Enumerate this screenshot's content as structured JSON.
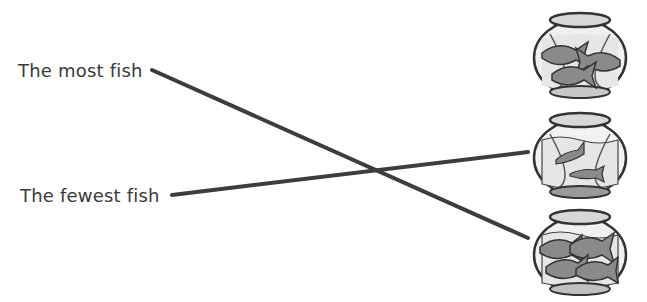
{
  "worksheet": {
    "labels": [
      {
        "id": "most",
        "text": "The most fish"
      },
      {
        "id": "fewest",
        "text": "The fewest fish"
      }
    ],
    "bowls": [
      {
        "position": "top",
        "fish_count": 3
      },
      {
        "position": "middle",
        "fish_count": 2
      },
      {
        "position": "bottom",
        "fish_count": 4
      }
    ],
    "matches": [
      {
        "label": "The most fish",
        "bowl": "bottom",
        "fish_count": 4
      },
      {
        "label": "The fewest fish",
        "bowl": "middle",
        "fish_count": 2
      }
    ],
    "colors": {
      "line": "#3d3d3d",
      "text": "#3a3a3a",
      "fish": "#8a8a8a",
      "bowl_outline": "#333333",
      "water": "#eeeeee"
    }
  }
}
